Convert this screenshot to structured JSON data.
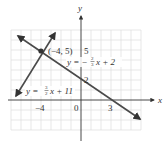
{
  "figure": {
    "axis_labels": {
      "x": "x",
      "y": "y"
    },
    "tick_labels": {
      "x_neg4": "−4",
      "origin": "0",
      "x_3": "3",
      "y_5": "5",
      "y_2": "2"
    },
    "point": {
      "label": "(−4, 5)",
      "x": -4,
      "y": 5
    },
    "lines": [
      {
        "name": "line-1",
        "eq_prefix": "y = −",
        "frac_num": "2",
        "frac_den": "3",
        "eq_suffix": "x + 2",
        "slope": -0.6667,
        "intercept": 2
      },
      {
        "name": "line-2",
        "eq_prefix": "y = ",
        "frac_num": "3",
        "frac_den": "2",
        "eq_suffix": "x + 11",
        "slope": 1.5,
        "intercept": 11
      }
    ],
    "colors": {
      "line": "#4a4a4a",
      "grid": "#dcdcdc",
      "axis": "#333333",
      "point": "#333333"
    }
  }
}
